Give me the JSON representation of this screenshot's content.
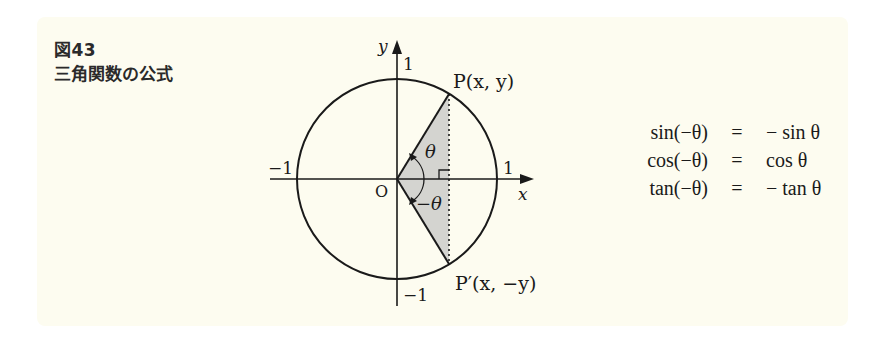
{
  "caption": {
    "figure_number": "図43",
    "title": "三角関数の公式"
  },
  "diagram": {
    "type": "unit-circle",
    "axis_labels": {
      "x": "x",
      "y": "y"
    },
    "origin_label": "O",
    "tick_labels": {
      "x_pos": "1",
      "x_neg": "−1",
      "y_pos": "1",
      "y_neg": "−1"
    },
    "points": {
      "P": "P(x, y)",
      "P_prime": "P′(x, −y)"
    },
    "angles": {
      "theta": "θ",
      "neg_theta": "−θ"
    },
    "colors": {
      "stroke": "#1a1a1a",
      "shade": "#d4d4d0",
      "panel": "#fdfcf0"
    }
  },
  "formulas": [
    {
      "lhs": "sin(−θ)",
      "eq": "=",
      "rhs": "− sin θ"
    },
    {
      "lhs": "cos(−θ)",
      "eq": "=",
      "rhs": "cos θ"
    },
    {
      "lhs": "tan(−θ)",
      "eq": "=",
      "rhs": "− tan θ"
    }
  ]
}
